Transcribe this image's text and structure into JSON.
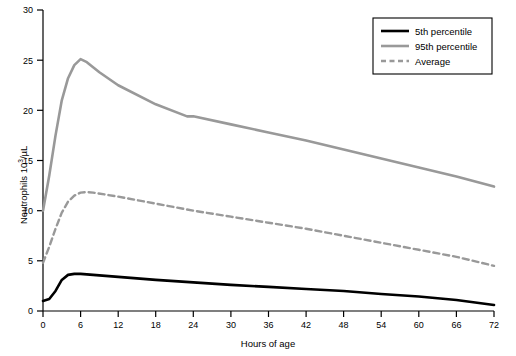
{
  "chart_data": {
    "type": "line",
    "title": "",
    "xlabel": "Hours of age",
    "ylabel": "Neutrophils 10³/µL",
    "xlim": [
      0,
      72
    ],
    "ylim": [
      0,
      30
    ],
    "xticks": [
      0,
      6,
      12,
      18,
      24,
      30,
      36,
      42,
      48,
      54,
      60,
      66,
      72
    ],
    "yticks": [
      0,
      5,
      10,
      15,
      20,
      25,
      30
    ],
    "grid": false,
    "legend_position": "top-right",
    "series": [
      {
        "name": "5th percentile",
        "color": "#000000",
        "style": "solid",
        "width": 2.6,
        "x": [
          0,
          1,
          2,
          3,
          4,
          5,
          6,
          7,
          8,
          12,
          18,
          24,
          30,
          36,
          42,
          48,
          54,
          60,
          66,
          72
        ],
        "y": [
          1.0,
          1.2,
          2.0,
          3.1,
          3.6,
          3.7,
          3.7,
          3.65,
          3.6,
          3.4,
          3.1,
          2.85,
          2.6,
          2.4,
          2.2,
          2.0,
          1.7,
          1.45,
          1.1,
          0.6
        ]
      },
      {
        "name": "95th percentile",
        "color": "#999999",
        "style": "solid",
        "width": 2.6,
        "x": [
          0,
          1,
          2,
          3,
          4,
          5,
          6,
          7,
          9,
          12,
          18,
          23,
          24,
          30,
          36,
          42,
          48,
          54,
          60,
          66,
          72
        ],
        "y": [
          10.0,
          13.5,
          17.5,
          21.0,
          23.2,
          24.5,
          25.1,
          24.8,
          23.8,
          22.5,
          20.6,
          19.4,
          19.4,
          18.6,
          17.8,
          17.0,
          16.1,
          15.2,
          14.3,
          13.4,
          12.4
        ]
      },
      {
        "name": "Average",
        "color": "#999999",
        "style": "dashed",
        "width": 2.4,
        "x": [
          0,
          1,
          2,
          3,
          4,
          5,
          6,
          7,
          8,
          12,
          18,
          24,
          30,
          36,
          42,
          48,
          54,
          60,
          66,
          72
        ],
        "y": [
          4.8,
          6.4,
          8.2,
          9.8,
          10.9,
          11.5,
          11.8,
          11.85,
          11.8,
          11.4,
          10.7,
          10.0,
          9.4,
          8.8,
          8.2,
          7.5,
          6.8,
          6.1,
          5.4,
          4.5
        ]
      }
    ],
    "legend": [
      {
        "label": "5th percentile",
        "color": "#000000",
        "style": "solid"
      },
      {
        "label": "95th percentile",
        "color": "#999999",
        "style": "solid"
      },
      {
        "label": "Average",
        "color": "#999999",
        "style": "dashed"
      }
    ]
  },
  "axis": {
    "xlabel": "Hours of age",
    "ylabel_main": "Neutrophils 10",
    "ylabel_sup": "3",
    "ylabel_unit": "/µL"
  },
  "ticks": {
    "x": [
      "0",
      "6",
      "12",
      "18",
      "24",
      "30",
      "36",
      "42",
      "48",
      "54",
      "60",
      "66",
      "72"
    ],
    "y": [
      "0",
      "5",
      "10",
      "15",
      "20",
      "25",
      "30"
    ]
  },
  "legend": {
    "item0": "5th percentile",
    "item1": "95th percentile",
    "item2": "Average"
  }
}
